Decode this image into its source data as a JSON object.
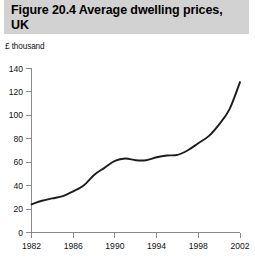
{
  "figure": {
    "title": "Figure 20.4  Average dwelling prices, UK"
  },
  "chart_data": {
    "type": "line",
    "title": "Figure 20.4  Average dwelling prices, UK",
    "subtitle": "",
    "xlabel": "",
    "ylabel": "£ thousand",
    "unit_label": "£ thousand",
    "xlim": [
      1982,
      2002
    ],
    "ylim": [
      0,
      140
    ],
    "ytick_labels": [
      "0",
      "20",
      "40",
      "60",
      "80",
      "100",
      "120",
      "140"
    ],
    "yticks": [
      0,
      20,
      40,
      60,
      80,
      100,
      120,
      140
    ],
    "xtick_labels": [
      "1982",
      "1986",
      "1990",
      "1994",
      "1998",
      "2002"
    ],
    "xticks": [
      1982,
      1986,
      1990,
      1994,
      1998,
      2002
    ],
    "grid": false,
    "legend": null,
    "line_color": "#1c1c1c",
    "series": [
      {
        "name": "Average dwelling price",
        "x": [
          1982,
          1983,
          1984,
          1985,
          1986,
          1987,
          1988,
          1989,
          1990,
          1991,
          1992,
          1993,
          1994,
          1995,
          1996,
          1997,
          1998,
          1999,
          2000,
          2001,
          2002
        ],
        "values": [
          24,
          27,
          29,
          31,
          35,
          40,
          49,
          55,
          61,
          63,
          61.5,
          61.5,
          64,
          65.5,
          66,
          70,
          76,
          82,
          92,
          105,
          128
        ]
      }
    ]
  },
  "colors": {
    "header_band": "#d2d2d2",
    "axis": "#8a8a8a",
    "line": "#1c1c1c",
    "text": "#111111"
  }
}
